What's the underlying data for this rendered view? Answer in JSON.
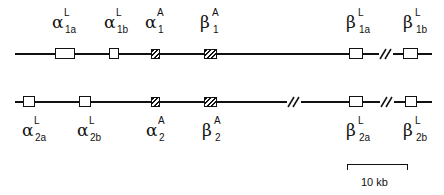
{
  "diagram": {
    "type": "gene-cluster-map",
    "legend": {
      "filled": "A (adult) genes - hatched",
      "open": "L (larval) genes - open"
    },
    "scale_bar": {
      "label": "10 kb"
    },
    "rows": [
      {
        "name": "cluster-1",
        "genes": [
          {
            "greek": "α",
            "sup": "L",
            "sub": "1a",
            "style": "open"
          },
          {
            "greek": "α",
            "sup": "L",
            "sub": "1b",
            "style": "open"
          },
          {
            "greek": "α",
            "sup": "A",
            "sub": "1",
            "style": "hatched"
          },
          {
            "greek": "β",
            "sup": "A",
            "sub": "1",
            "style": "hatched"
          },
          {
            "greek": "β",
            "sup": "L",
            "sub": "1a",
            "style": "open"
          },
          {
            "greek": "β",
            "sup": "L",
            "sub": "1b",
            "style": "open"
          }
        ],
        "breaks": 1
      },
      {
        "name": "cluster-2",
        "genes": [
          {
            "greek": "α",
            "sup": "L",
            "sub": "2a",
            "style": "open"
          },
          {
            "greek": "α",
            "sup": "L",
            "sub": "2b",
            "style": "open"
          },
          {
            "greek": "α",
            "sup": "A",
            "sub": "2",
            "style": "hatched"
          },
          {
            "greek": "β",
            "sup": "A",
            "sub": "2",
            "style": "hatched"
          },
          {
            "greek": "β",
            "sup": "L",
            "sub": "2a",
            "style": "open"
          },
          {
            "greek": "β",
            "sup": "L",
            "sub": "2b",
            "style": "open"
          }
        ],
        "breaks": 2
      }
    ]
  }
}
